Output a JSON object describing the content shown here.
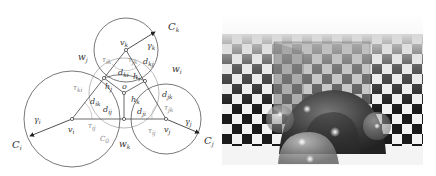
{
  "left_diagram": {
    "labels": {
      "circle_k": "C",
      "circle_k_sub": "k",
      "circle_i": "C",
      "circle_i_sub": "i",
      "circle_j": "C",
      "circle_j_sub": "j",
      "circle_0": "C",
      "circle_0_sub": "0",
      "vertex_k": "v",
      "vertex_k_sub": "k",
      "vertex_i": "v",
      "vertex_i_sub": "i",
      "vertex_j": "v",
      "vertex_j_sub": "j",
      "center": "o",
      "gamma_k": "γ",
      "gamma_k_sub": "k",
      "gamma_i": "γ",
      "gamma_i_sub": "i",
      "gamma_j": "γ",
      "gamma_j_sub": "j",
      "w_i": "w",
      "w_i_sub": "i",
      "w_j": "w",
      "w_j_sub": "j",
      "w_k": "w",
      "w_k_sub": "k",
      "tau_ik": "τ",
      "tau_ik_sub": "ik",
      "tau_jk": "τ",
      "tau_jk_sub": "jk",
      "tau_ki": "τ",
      "tau_ki_sub": "ki",
      "tau_ij": "τ",
      "tau_ij_sub": "ij",
      "tau_jk2": "τ",
      "tau_jk2_sub": "jk",
      "tau_ij2": "τ",
      "tau_ij2_sub": "ij",
      "d_ki": "d",
      "d_ki_sub": "ki",
      "d_kj": "d",
      "d_kj_sub": "kj",
      "d_ik": "d",
      "d_ik_sub": "ik",
      "d_ij": "d",
      "d_ij_sub": "ij",
      "d_jk": "d",
      "d_jk_sub": "jk",
      "d_ji": "d",
      "d_ji_sub": "ji",
      "h_i": "h",
      "h_i_sub": "i",
      "h_j": "h",
      "h_j_sub": "j",
      "h_k": "h",
      "h_k_sub": "k"
    }
  },
  "right_render": {
    "description": "ray-traced scene: translucent box and spheres on checkerboard plane",
    "colors": {
      "sky_top": "#ffffff",
      "sky_bottom": "#d8d8d8",
      "dark_tile": "#1a1a1a",
      "light_tile": "#f4f4f4"
    }
  }
}
